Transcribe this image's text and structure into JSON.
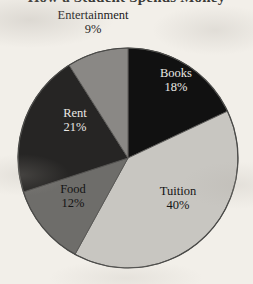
{
  "page": {
    "background_color": "#f2efe9",
    "clipped_title": "How a Student Spends Money"
  },
  "chart_data": {
    "type": "pie",
    "title": "",
    "xlabel": "",
    "ylabel": "",
    "legend_position": "none",
    "labels_inline": true,
    "start_angle_deg": 0,
    "direction": "clockwise",
    "center": {
      "x": 128,
      "y": 158
    },
    "radius": 110,
    "categories": [
      "Books",
      "Tuition",
      "Food",
      "Rent",
      "Entertainment"
    ],
    "values": [
      18,
      40,
      12,
      21,
      9
    ],
    "unit": "%",
    "slices": [
      {
        "name": "Books",
        "label": "Books",
        "percent": 18,
        "percent_text": "18%",
        "fill": "#111111",
        "text_color": "#eae8e4",
        "start_deg": 0,
        "end_deg": 64.8
      },
      {
        "name": "Tuition",
        "label": "Tuition",
        "percent": 40,
        "percent_text": "40%",
        "fill": "#c8c6c1",
        "text_color": "#141414",
        "start_deg": 64.8,
        "end_deg": 208.8
      },
      {
        "name": "Food",
        "label": "Food",
        "percent": 12,
        "percent_text": "12%",
        "fill": "#6e6d6a",
        "text_color": "#141414",
        "start_deg": 208.8,
        "end_deg": 252.0
      },
      {
        "name": "Rent",
        "label": "Rent",
        "percent": 21,
        "percent_text": "21%",
        "fill": "#262524",
        "text_color": "#eae8e4",
        "start_deg": 252.0,
        "end_deg": 327.6
      },
      {
        "name": "Entertainment",
        "label": "Entertainment",
        "percent": 9,
        "percent_text": "9%",
        "fill": "#8a8885",
        "text_color": "#1a1a1a",
        "start_deg": 327.6,
        "end_deg": 360.0
      }
    ]
  }
}
